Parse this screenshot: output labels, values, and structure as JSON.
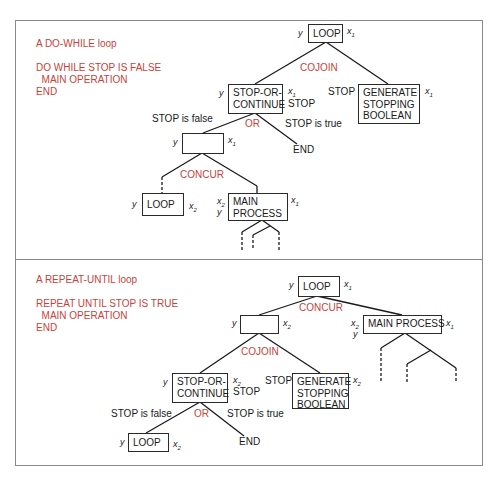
{
  "panels": [
    {
      "title": "A DO-WHILE loop",
      "pseudocode": [
        "DO WHILE STOP IS FALSE",
        "  MAIN OPERATION",
        "END"
      ],
      "nodes": {
        "root": {
          "label": "LOOP",
          "in": "y",
          "out": "x1"
        },
        "cojoin_label": "COJOIN",
        "stop_or_continue": {
          "label": "STOP-OR-\nCONTINUE",
          "in": "y",
          "out": "x1",
          "out2": "STOP"
        },
        "generate": {
          "label": "GENERATE\nSTOPPING\nBOOLEAN",
          "in": "STOP",
          "out": "x1"
        },
        "or_label": "OR",
        "branch_false": "STOP is false",
        "branch_true": "STOP is true",
        "empty_box": {
          "label": "",
          "in": "y",
          "out": "x1"
        },
        "end": "END",
        "concur_label": "CONCUR",
        "loop_child": {
          "label": "LOOP",
          "in": "y",
          "out": "x2"
        },
        "main_process": {
          "label": "MAIN\nPROCESS",
          "in": "x2",
          "in2": "y",
          "out": "x1"
        }
      }
    },
    {
      "title": "A REPEAT-UNTIL loop",
      "pseudocode": [
        "REPEAT UNTIL STOP IS TRUE",
        "  MAIN OPERATION",
        "END"
      ],
      "nodes": {
        "root": {
          "label": "LOOP",
          "in": "y",
          "out": "x1"
        },
        "concur_label": "CONCUR",
        "empty_box": {
          "label": "",
          "in": "y",
          "out": "x2"
        },
        "main_process": {
          "label": "MAIN PROCESS",
          "in": "x2",
          "in2": "y",
          "out": "x1"
        },
        "cojoin_label": "COJOIN",
        "stop_or_continue": {
          "label": "STOP-OR-\nCONTINUE",
          "in": "y",
          "out": "x2",
          "out2": "STOP"
        },
        "generate": {
          "label": "GENERATE\nSTOPPING\nBOOLEAN",
          "in": "STOP",
          "out": "x2"
        },
        "or_label": "OR",
        "branch_false": "STOP is false",
        "branch_true": "STOP is true",
        "loop_child": {
          "label": "LOOP",
          "in": "y",
          "out": "x2"
        },
        "end": "END"
      }
    }
  ],
  "colors": {
    "accent": "#c8423a",
    "ink": "#1a1a1a",
    "frame": "#8a8a8a"
  }
}
